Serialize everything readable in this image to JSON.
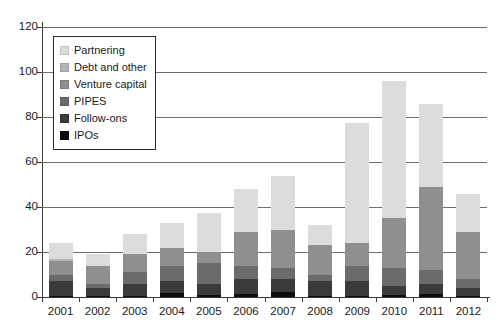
{
  "chart_data": {
    "type": "bar",
    "subtype": "stacked-bar",
    "title": "",
    "subtitle": "",
    "xlabel": "",
    "ylabel": "",
    "categories": [
      "2001",
      "2002",
      "2003",
      "2004",
      "2005",
      "2006",
      "2007",
      "2008",
      "2009",
      "2010",
      "2011",
      "2012"
    ],
    "ylim": [
      0,
      120
    ],
    "yticks": [
      0,
      20,
      40,
      60,
      80,
      100,
      120
    ],
    "ytick_labels": [
      "0",
      "20",
      "40",
      "60",
      "80",
      "100",
      "120"
    ],
    "grid": "horizontal",
    "legend_position": "upper-left-inside",
    "stack_order_bottom_to_top": [
      "IPOs",
      "Follow-ons",
      "PIPES",
      "Venture capital",
      "Debt and other",
      "Partnering"
    ],
    "series": [
      {
        "name": "IPOs",
        "color": "#0d0d0d",
        "values": [
          0.5,
          0.3,
          0.4,
          2.0,
          0.8,
          1.2,
          2.4,
          0.5,
          0.4,
          0.8,
          1.4,
          0.6
        ]
      },
      {
        "name": "Follow-ons",
        "color": "#3b3b3b",
        "values": [
          6.5,
          3.7,
          5.6,
          5.0,
          5.2,
          6.8,
          5.6,
          6.5,
          6.6,
          4.2,
          4.6,
          3.4
        ]
      },
      {
        "name": "PIPES",
        "color": "#6b6b6b",
        "values": [
          3.0,
          2.0,
          5.0,
          7.0,
          9.0,
          6.0,
          5.0,
          3.0,
          7.0,
          8.0,
          6.0,
          4.0
        ]
      },
      {
        "name": "Venture capital",
        "color": "#8f8f8f",
        "values": [
          6.0,
          8.0,
          8.0,
          8.0,
          5.0,
          15.0,
          17.0,
          13.0,
          10.0,
          22.0,
          37.0,
          21.0
        ]
      },
      {
        "name": "Debt and other",
        "color": "#b4b4b4",
        "values": [
          1.0,
          0.0,
          0.0,
          0.0,
          0.0,
          0.0,
          0.0,
          0.0,
          0.0,
          0.0,
          0.0,
          0.0
        ]
      },
      {
        "name": "Partnering",
        "color": "#dcdcdc",
        "values": [
          7.0,
          5.0,
          9.0,
          11.0,
          17.5,
          19.0,
          24.0,
          9.0,
          53.5,
          61.0,
          37.0,
          17.0
        ]
      }
    ],
    "totals": [
      24,
      19,
      28,
      33,
      37.5,
      48,
      54,
      32,
      77.5,
      96,
      86,
      46
    ],
    "legend_entries": [
      {
        "label": "Partnering",
        "color": "#dcdcdc"
      },
      {
        "label": "Debt and other",
        "color": "#b4b4b4"
      },
      {
        "label": "Venture capital",
        "color": "#8f8f8f"
      },
      {
        "label": "PIPES",
        "color": "#6b6b6b"
      },
      {
        "label": "Follow-ons",
        "color": "#3b3b3b"
      },
      {
        "label": "IPOs",
        "color": "#0d0d0d"
      }
    ]
  },
  "style": {
    "background": "#ffffff",
    "axis_color": "#3a3a3a",
    "grid_color": "#6e6e6e",
    "text_color": "#1a1a1a",
    "legend_border": "#2a2a2a"
  }
}
